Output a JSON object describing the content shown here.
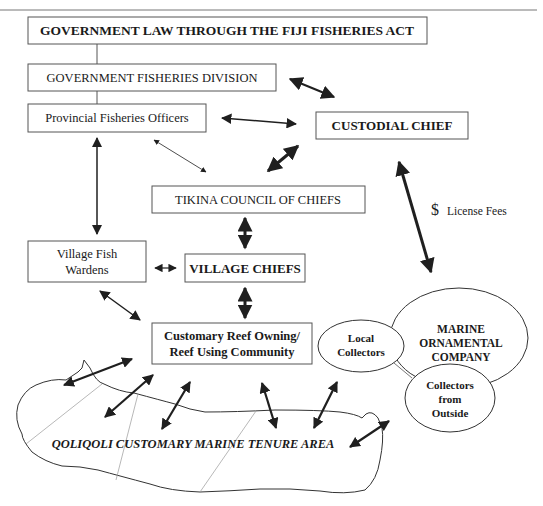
{
  "colors": {
    "stroke": "#555555",
    "arrow": "#1f1f1f",
    "text": "#1a1a1a",
    "thin": "#9a9a9a"
  },
  "nodes": {
    "fisheries_act": {
      "label": "GOVERNMENT LAW THROUGH THE FIJI FISHERIES ACT",
      "x": 28,
      "y": 17,
      "w": 399,
      "h": 27,
      "bold": true,
      "size": 13.5
    },
    "fisheries_division": {
      "label": "GOVERNMENT FISHERIES DIVISION",
      "x": 28,
      "y": 64,
      "w": 248,
      "h": 27,
      "bold": false,
      "size": 12.5
    },
    "provincial_officers": {
      "label": "Provincial Fisheries Officers",
      "x": 28,
      "y": 104,
      "w": 178,
      "h": 28,
      "bold": false,
      "size": 12.5
    },
    "custodial_chief": {
      "label": "CUSTODIAL CHIEF",
      "x": 316,
      "y": 112,
      "w": 152,
      "h": 27,
      "bold": true,
      "size": 13
    },
    "tikina_council": {
      "label": "TIKINA COUNCIL OF CHIEFS",
      "x": 152,
      "y": 186,
      "w": 213,
      "h": 27,
      "bold": false,
      "size": 12.5
    },
    "fish_wardens": {
      "label_lines": [
        "Village Fish",
        "Wardens"
      ],
      "x": 28,
      "y": 241,
      "w": 118,
      "h": 41,
      "bold": false,
      "size": 12.5
    },
    "village_chiefs": {
      "label": "VILLAGE CHIEFS",
      "x": 185,
      "y": 254,
      "w": 120,
      "h": 28,
      "bold": true,
      "size": 13
    },
    "reef_community": {
      "label_lines": [
        "Customary Reef Owning/",
        "Reef Using Community"
      ],
      "x": 152,
      "y": 323,
      "w": 160,
      "h": 41,
      "bold": true,
      "size": 12.5
    }
  },
  "ellipses": {
    "marine_company": {
      "label_lines": [
        "MARINE",
        "ORNAMENTAL",
        "COMPANY"
      ],
      "cx": 459,
      "cy": 338,
      "rx": 69,
      "ry": 50,
      "size": 11.5
    },
    "local_collectors": {
      "label_lines": [
        "Local",
        "Collectors"
      ],
      "cx": 361,
      "cy": 346,
      "rx": 43,
      "ry": 26,
      "size": 11
    },
    "outside_collectors": {
      "label_lines": [
        "Collectors",
        "from",
        "Outside"
      ],
      "cx": 450,
      "cy": 398,
      "rx": 45,
      "ry": 34,
      "size": 11
    }
  },
  "annotations": {
    "license_fees_symbol": "$",
    "license_fees_label": "License Fees",
    "tenure_area": "QOLIQOLI CUSTOMARY MARINE TENURE AREA"
  }
}
